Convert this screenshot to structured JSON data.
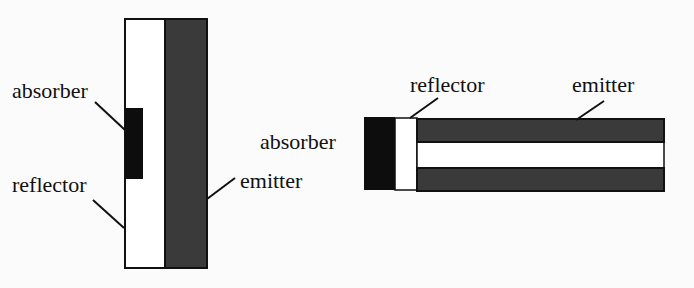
{
  "colors": {
    "background": "#fbfbfb",
    "emitter": "#3a3a3a",
    "absorber": "#0d0d0d",
    "reflector": "#ffffff",
    "outline": "#111111"
  },
  "left_diagram": {
    "labels": {
      "absorber": "absorber",
      "reflector": "reflector",
      "emitter": "emitter"
    }
  },
  "right_diagram": {
    "labels": {
      "absorber": "absorber",
      "reflector": "reflector",
      "emitter": "emitter"
    }
  }
}
